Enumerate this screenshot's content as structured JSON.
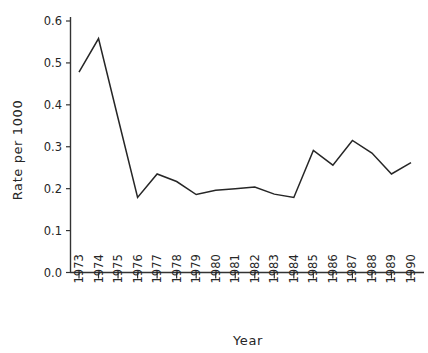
{
  "chart_data": {
    "type": "line",
    "title": "",
    "subtitle": "",
    "xlabel": "Year",
    "ylabel": "Rate per 1000",
    "x": [
      1973,
      1974,
      1975,
      1976,
      1977,
      1978,
      1979,
      1980,
      1981,
      1982,
      1983,
      1984,
      1985,
      1986,
      1987,
      1988,
      1989,
      1990
    ],
    "categories": [
      "1973",
      "1974",
      "1975",
      "1976",
      "1977",
      "1978",
      "1979",
      "1980",
      "1981",
      "1982",
      "1983",
      "1984",
      "1985",
      "1986",
      "1987",
      "1988",
      "1989",
      "1990"
    ],
    "values": [
      0.478,
      0.558,
      0.368,
      0.179,
      0.235,
      0.217,
      0.186,
      0.196,
      0.2,
      0.204,
      0.187,
      0.179,
      0.291,
      0.256,
      0.315,
      0.285,
      0.235,
      0.262
    ],
    "series": [
      {
        "name": "Rate per 1000",
        "values": [
          0.478,
          0.558,
          0.368,
          0.179,
          0.235,
          0.217,
          0.186,
          0.196,
          0.2,
          0.204,
          0.187,
          0.179,
          0.291,
          0.256,
          0.315,
          0.285,
          0.235,
          0.262
        ],
        "color": "#262626"
      }
    ],
    "xlim": [
      1973,
      1990
    ],
    "ylim": [
      0.0,
      0.6
    ],
    "ytick_labels": [
      "0.0",
      "0.1",
      "0.2",
      "0.3",
      "0.4",
      "0.5",
      "0.6"
    ],
    "ytick_values": [
      0.0,
      0.1,
      0.2,
      0.3,
      0.4,
      0.5,
      0.6
    ],
    "xtick_labels": [
      "1973",
      "1974",
      "1975",
      "1976",
      "1977",
      "1978",
      "1979",
      "1980",
      "1981",
      "1982",
      "1983",
      "1984",
      "1985",
      "1986",
      "1987",
      "1988",
      "1989",
      "1990"
    ],
    "grid": false,
    "legend": false,
    "legend_position": "none",
    "line_color": "#262626",
    "axis_color": "#333333",
    "background_color": "#ffffff"
  },
  "axis_titles": {
    "x": "Year",
    "y": "Rate per 1000"
  }
}
